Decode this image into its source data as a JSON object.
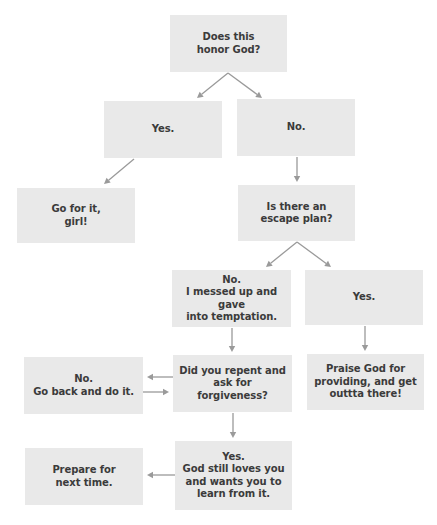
{
  "diagram": {
    "type": "flowchart",
    "nodes": {
      "honor_god": {
        "label": "Does this\nhonor God?"
      },
      "honor_yes": {
        "label": "Yes."
      },
      "honor_no": {
        "label": "No."
      },
      "go_for_it": {
        "label": "Go for it,\ngirl!"
      },
      "escape_plan": {
        "label": "Is there an\nescape plan?"
      },
      "escape_no": {
        "label": "No.\nI messed up and gave\ninto temptation."
      },
      "escape_yes": {
        "label": "Yes."
      },
      "repent": {
        "label": "Did you repent and\nask for forgiveness?"
      },
      "repent_no": {
        "label": "No.\nGo back and do it."
      },
      "praise_god": {
        "label": "Praise God for\nproviding, and get\nouttta there!"
      },
      "repent_yes": {
        "label": "Yes.\nGod still loves you\nand wants you to\nlearn from it."
      },
      "prepare": {
        "label": "Prepare for\nnext time."
      }
    },
    "edges": [
      {
        "from": "honor_god",
        "to": "honor_yes"
      },
      {
        "from": "honor_god",
        "to": "honor_no"
      },
      {
        "from": "honor_yes",
        "to": "go_for_it"
      },
      {
        "from": "honor_no",
        "to": "escape_plan"
      },
      {
        "from": "escape_plan",
        "to": "escape_no"
      },
      {
        "from": "escape_plan",
        "to": "escape_yes"
      },
      {
        "from": "escape_no",
        "to": "repent"
      },
      {
        "from": "escape_yes",
        "to": "praise_god"
      },
      {
        "from": "repent",
        "to": "repent_no"
      },
      {
        "from": "repent_no",
        "to": "repent"
      },
      {
        "from": "repent",
        "to": "repent_yes"
      },
      {
        "from": "repent_yes",
        "to": "prepare"
      }
    ]
  },
  "colors": {
    "node_fill": "#e9e9e9",
    "node_text": "#3b3b3b",
    "edge": "#9a9a9a",
    "background": "#ffffff"
  }
}
